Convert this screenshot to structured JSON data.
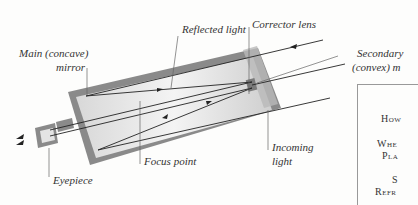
{
  "diagram": {
    "labels": {
      "main_mirror": [
        "Main (concave)",
        "mirror"
      ],
      "reflected_light": "Reflected light",
      "corrector_lens": "Corrector lens",
      "secondary_mirror": [
        "Secondary",
        "(convex) m"
      ],
      "focus_point": "Focus point",
      "incoming_light": [
        "Incoming",
        "light"
      ],
      "eyepiece": "Eyepiece"
    },
    "colors": {
      "tube": "#8a8a8a",
      "tube_inner": "#e8e8e8",
      "line": "#222222"
    }
  },
  "sidebar": {
    "items": [
      "How",
      "Whe",
      "Pla",
      "S",
      "Refr"
    ]
  }
}
